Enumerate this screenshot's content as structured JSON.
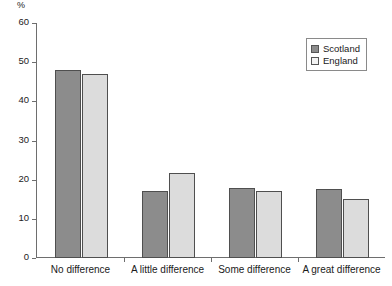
{
  "chart_data": {
    "type": "bar",
    "title": "",
    "xlabel": "",
    "ylabel": "%",
    "ylim": [
      0,
      60
    ],
    "yticks": [
      0,
      10,
      20,
      30,
      40,
      50,
      60
    ],
    "grid": false,
    "legend_position": "top-right",
    "categories": [
      "No difference",
      "A little difference",
      "Some difference",
      "A great difference"
    ],
    "series": [
      {
        "name": "Scotland",
        "color": "#8c8c8c",
        "values": [
          48,
          17,
          18,
          17.5
        ]
      },
      {
        "name": "England",
        "color": "#dcdcdc",
        "values": [
          47,
          21.7,
          17,
          15
        ]
      }
    ]
  },
  "axis": {
    "unit_label": "%",
    "tick_labels": [
      "60",
      "50",
      "40",
      "30",
      "20",
      "10",
      "0"
    ]
  },
  "legend": {
    "items": [
      {
        "label": "Scotland"
      },
      {
        "label": "England"
      }
    ]
  }
}
